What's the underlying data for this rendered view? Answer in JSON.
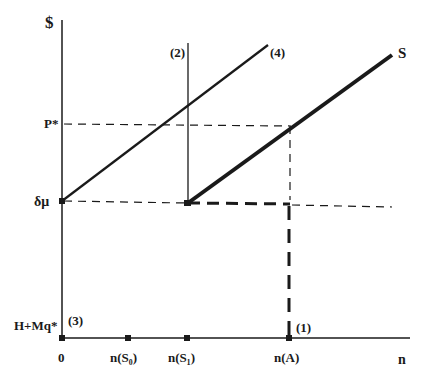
{
  "diagram": {
    "y_axis_label": "$",
    "x_axis_label": "n",
    "y_levels": {
      "p_star": "P*",
      "delta_mu": "δμ",
      "h_mq": "H+Mq*"
    },
    "x_ticks": {
      "origin": "0",
      "n_s0": "n(S₀)",
      "n_s1": "n(S₁)",
      "n_a": "n(A)"
    },
    "curve_labels": {
      "c1": "(1)",
      "c2": "(2)",
      "c3": "(3)",
      "c4": "(4)",
      "s": "S"
    },
    "colors": {
      "ink": "#1a1a1a",
      "background": "#ffffff"
    }
  }
}
